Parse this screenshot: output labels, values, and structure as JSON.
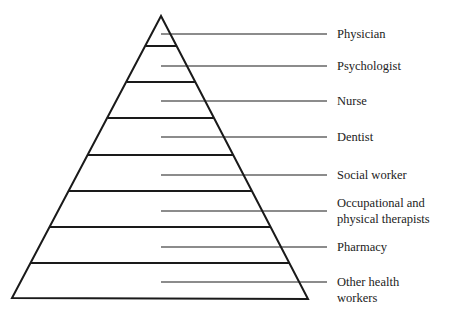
{
  "diagram": {
    "type": "pyramid",
    "line_color": "#1a1a1a",
    "labels": [
      {
        "text": "Physician",
        "y": 34
      },
      {
        "text": "Psychologist",
        "y": 66
      },
      {
        "text": "Nurse",
        "y": 101
      },
      {
        "text": "Dentist",
        "y": 137
      },
      {
        "text": "Social worker",
        "y": 175
      },
      {
        "text": "Occupational and physical therapists",
        "line1": "Occupational and",
        "line2": "physical therapists",
        "y": 211
      },
      {
        "text": "Pharmacy",
        "y": 247
      },
      {
        "text": "Other health workers",
        "line1": "Other health",
        "line2": "workers",
        "y": 282
      }
    ]
  }
}
